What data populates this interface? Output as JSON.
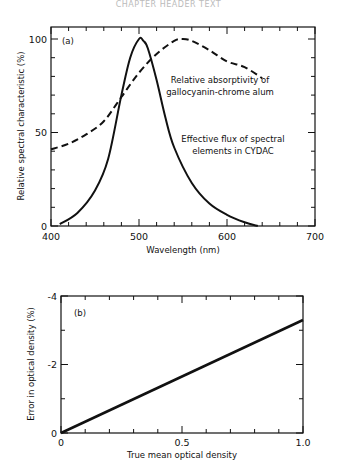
{
  "header": {
    "text": "CHAPTER HEADER TEXT"
  },
  "chart_data": [
    {
      "type": "line",
      "panel_label": "(a)",
      "title": "",
      "xlabel": "Wavelength (nm)",
      "ylabel": "Relative spectral characteristic (%)",
      "xlim": [
        400,
        700
      ],
      "ylim": [
        0,
        100
      ],
      "xticks": [
        "400",
        "500",
        "600",
        "700"
      ],
      "yticks": [
        "0",
        "50",
        "100"
      ],
      "grid": false,
      "series": [
        {
          "name": "Relative absorptivity of gallocyanin-chrome alum",
          "style": "dashed",
          "x": [
            400,
            420,
            440,
            460,
            480,
            500,
            520,
            540,
            550,
            560,
            580,
            600,
            620,
            640
          ],
          "y": [
            41,
            44,
            49,
            56,
            69,
            82,
            92,
            99,
            100,
            99,
            94,
            88,
            85,
            79
          ]
        },
        {
          "name": "Effective flux of spectral elements in CYDAC",
          "style": "solid",
          "x": [
            410,
            430,
            450,
            465,
            480,
            490,
            500,
            505,
            510,
            520,
            530,
            540,
            560,
            580,
            600,
            620,
            635
          ],
          "y": [
            1,
            7,
            19,
            36,
            70,
            90,
            100,
            99,
            95,
            78,
            58,
            42,
            23,
            12,
            6,
            2,
            0
          ]
        }
      ],
      "annotations": [
        "Relative absorptivity of",
        "gallocyanin-chrome alum",
        "Effective flux of spectral",
        "elements in CYDAC"
      ]
    },
    {
      "type": "line",
      "panel_label": "(b)",
      "title": "",
      "xlabel": "True mean optical density",
      "ylabel": "Error in optical density (%)",
      "xlim": [
        0,
        1.0
      ],
      "ylim": [
        0,
        -4
      ],
      "xticks": [
        "0",
        "0.5",
        "1.0"
      ],
      "yticks": [
        "0",
        "-2",
        "-4"
      ],
      "grid": false,
      "series": [
        {
          "name": "Error",
          "style": "solid",
          "x": [
            0,
            0.5,
            1.0
          ],
          "y": [
            0,
            -1.65,
            -3.3
          ]
        }
      ]
    }
  ]
}
